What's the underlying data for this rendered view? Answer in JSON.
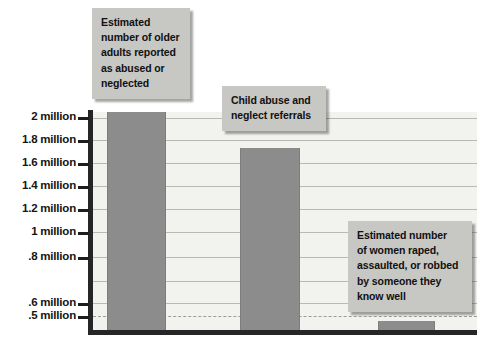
{
  "chart_data": {
    "type": "bar",
    "title": "",
    "subtitle": "",
    "xlabel": "",
    "ylabel": "",
    "ylim": [
      0.4,
      2.12
    ],
    "grid": true,
    "legend_position": "none",
    "categories": [
      "Estimated number of older adults reported as abused or neglected",
      "Child abuse and neglect referrals",
      "Estimated number of women raped, assaulted, or robbed by someone they know well"
    ],
    "values": [
      2.12,
      1.73,
      0.5
    ],
    "value_units": "millions",
    "bar_color": "#8c8c8c",
    "tick_labels": [
      "2 million",
      "1.8 million",
      "1.6 million",
      "1.4 million",
      "1.2 million",
      "1 million",
      ".8 million",
      ".6 million",
      ".5 million"
    ],
    "tick_values": [
      2,
      1.8,
      1.6,
      1.4,
      1.2,
      1,
      0.8,
      0.6,
      0.5
    ]
  },
  "axis": {
    "ticks": [
      {
        "label": "2 million",
        "y": 117
      },
      {
        "label": "1.8 million",
        "y": 140
      },
      {
        "label": "1.6 million",
        "y": 163
      },
      {
        "label": "1.4 million",
        "y": 186
      },
      {
        "label": "1.2 million",
        "y": 209
      },
      {
        "label": "1 million",
        "y": 232
      },
      {
        "label": ".8 million",
        "y": 257
      },
      {
        "label": ".6 million",
        "y": 303
      },
      {
        "label": ".5 million",
        "y": 316
      }
    ]
  },
  "callouts": [
    {
      "name": "older-adults",
      "lines": [
        "Estimated",
        "number of older",
        "adults reported",
        "as abused or",
        "neglected"
      ]
    },
    {
      "name": "child-abuse",
      "lines": [
        "Child abuse and",
        "neglect referrals"
      ]
    },
    {
      "name": "women-assaulted",
      "lines": [
        "Estimated number",
        "of women raped,",
        "assaulted, or robbed",
        "by someone they",
        "know well"
      ]
    }
  ],
  "bars": [
    {
      "name": "bar-older-adults",
      "left": 107,
      "top": 112,
      "width": 57,
      "height": 219
    },
    {
      "name": "bar-child-abuse",
      "left": 240,
      "top": 148,
      "width": 58,
      "height": 183
    },
    {
      "name": "bar-women-assaulted",
      "left": 378,
      "top": 321,
      "width": 55,
      "height": 10
    }
  ],
  "gridlines": [
    118,
    140,
    163,
    186,
    209,
    232,
    257,
    281,
    303
  ],
  "dashed_gridline": 316,
  "colors": {
    "bar": "#8c8c8c",
    "callout_bg": "#c7c7c3",
    "plot_bg": "#f2f2ee",
    "axis": "#262626",
    "gridline": "#b9b9b4",
    "text": "#111111"
  }
}
